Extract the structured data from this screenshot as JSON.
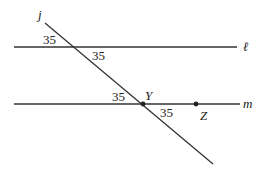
{
  "diagram": {
    "lines": [
      {
        "id": "l",
        "label": "ℓ"
      },
      {
        "id": "m",
        "label": "m"
      },
      {
        "id": "j",
        "label": "j"
      }
    ],
    "points": [
      {
        "id": "Y",
        "label": "Y"
      },
      {
        "id": "Z",
        "label": "Z"
      }
    ],
    "angle_labels": [
      {
        "value": "35",
        "where": "above line l, left of transversal j"
      },
      {
        "value": "35",
        "where": "below line l, right of transversal j"
      },
      {
        "value": "35",
        "where": "above line m, left of transversal j"
      },
      {
        "value": "35",
        "where": "below line m, right of transversal j (angle at Y toward Z)"
      }
    ]
  },
  "colors": {
    "line": "#333333",
    "text": "#222222",
    "background": "#ffffff"
  }
}
